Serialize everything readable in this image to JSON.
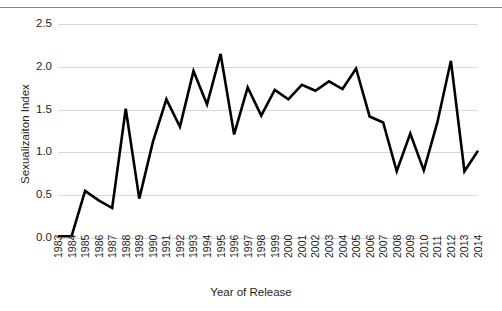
{
  "figure": {
    "top_cut_text": "",
    "background_color": "#ffffff",
    "line_color": "#000000",
    "gridline_color": "#d9d9d9",
    "text_color": "#231f20"
  },
  "chart_data": {
    "type": "line",
    "title": "",
    "xlabel": "Year of Release",
    "ylabel": "Sexualizaiton Index",
    "xlim": [
      1983,
      2014
    ],
    "ylim": [
      0.0,
      2.5
    ],
    "ytick_labels": [
      "0.0",
      "0.5",
      "1.0",
      "1.5",
      "2.0",
      "2.5"
    ],
    "ytick_values": [
      0.0,
      0.5,
      1.0,
      1.5,
      2.0,
      2.5
    ],
    "grid": true,
    "legend": false,
    "categories": [
      "1983",
      "1984",
      "1985",
      "1986",
      "1987",
      "1988",
      "1989",
      "1990",
      "1991",
      "1992",
      "1993",
      "1994",
      "1995",
      "1996",
      "1997",
      "1998",
      "1999",
      "2000",
      "2001",
      "2002",
      "2003",
      "2004",
      "2005",
      "2006",
      "2007",
      "2008",
      "2009",
      "2010",
      "2011",
      "2012",
      "2013",
      "2014"
    ],
    "values": [
      0.02,
      0.02,
      0.55,
      0.44,
      0.35,
      1.51,
      0.46,
      1.12,
      1.62,
      1.3,
      1.95,
      1.56,
      2.15,
      1.21,
      1.76,
      1.43,
      1.73,
      1.62,
      1.79,
      1.72,
      1.83,
      1.74,
      1.98,
      1.42,
      1.35,
      0.78,
      1.22,
      0.79,
      1.35,
      2.07,
      0.78,
      1.02
    ]
  }
}
